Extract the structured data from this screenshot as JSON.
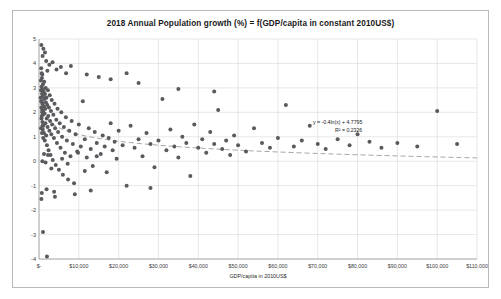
{
  "chart_data": {
    "type": "scatter",
    "title": "2018 Annual Population growth (%) = f(GDP/capita in constant 2010US$)",
    "xlabel": "GDP/capita in 2010US$",
    "ylabel": "Annual % population increase",
    "xlim": [
      0,
      110000
    ],
    "ylim": [
      -4,
      5
    ],
    "grid": true,
    "legend": null,
    "xticks": [
      0,
      10000,
      20000,
      30000,
      40000,
      50000,
      60000,
      70000,
      80000,
      90000,
      100000,
      110000
    ],
    "xtick_labels": [
      "$-",
      "$10,000",
      "$20,000",
      "$30,000",
      "$40,000",
      "$50,000",
      "$60,000",
      "$70,000",
      "$80,000",
      "$90,000",
      "$100,000",
      "$110,000"
    ],
    "yticks": [
      -4,
      -3,
      -2,
      -1,
      0,
      1,
      2,
      3,
      4,
      5
    ],
    "ytick_labels": [
      "-4",
      "-3",
      "-2",
      "-1",
      "0",
      "1",
      "2",
      "3",
      "4",
      "5"
    ],
    "marker_color": "#59595e",
    "marker_size": 2.0,
    "trendline": {
      "type": "logarithmic",
      "equation": "y = -0.4ln(x) + 4.7795",
      "r_squared": "R² = 0.2326",
      "slope_coefficient": -0.4,
      "intercept": 4.7795,
      "r2_value": 0.2326,
      "style": "dashed",
      "color": "#8c8c8c"
    },
    "points": [
      [
        420,
        2.6
      ],
      [
        480,
        3.3
      ],
      [
        520,
        2.9
      ],
      [
        560,
        3.8
      ],
      [
        600,
        2.2
      ],
      [
        640,
        3.05
      ],
      [
        680,
        2.45
      ],
      [
        700,
        1.85
      ],
      [
        730,
        3.4
      ],
      [
        760,
        2.75
      ],
      [
        790,
        2.1
      ],
      [
        820,
        3.55
      ],
      [
        850,
        1.6
      ],
      [
        880,
        2.35
      ],
      [
        910,
        2.95
      ],
      [
        940,
        1.3
      ],
      [
        970,
        2.65
      ],
      [
        1000,
        3.15
      ],
      [
        1050,
        2.05
      ],
      [
        1100,
        1.45
      ],
      [
        1150,
        2.85
      ],
      [
        1200,
        2.25
      ],
      [
        1250,
        1.15
      ],
      [
        1300,
        3.25
      ],
      [
        1350,
        2.55
      ],
      [
        1400,
        1.95
      ],
      [
        1450,
        0.85
      ],
      [
        1500,
        2.75
      ],
      [
        1560,
        2.15
      ],
      [
        1620,
        1.55
      ],
      [
        1680,
        3.0
      ],
      [
        1740,
        2.4
      ],
      [
        1800,
        1.05
      ],
      [
        1870,
        2.6
      ],
      [
        1940,
        1.75
      ],
      [
        2000,
        0.65
      ],
      [
        2080,
        2.3
      ],
      [
        2160,
        1.4
      ],
      [
        2240,
        2.9
      ],
      [
        2320,
        1.85
      ],
      [
        2400,
        0.45
      ],
      [
        2500,
        2.2
      ],
      [
        2600,
        1.25
      ],
      [
        2700,
        2.7
      ],
      [
        2800,
        1.65
      ],
      [
        2900,
        0.25
      ],
      [
        3000,
        2.05
      ],
      [
        3100,
        1.1
      ],
      [
        3200,
        2.5
      ],
      [
        3300,
        1.5
      ],
      [
        3450,
        0.05
      ],
      [
        3600,
        1.9
      ],
      [
        3750,
        0.95
      ],
      [
        3900,
        2.35
      ],
      [
        4050,
        1.35
      ],
      [
        4200,
        -0.15
      ],
      [
        4350,
        1.7
      ],
      [
        4500,
        0.75
      ],
      [
        4650,
        2.15
      ],
      [
        4800,
        1.2
      ],
      [
        5000,
        -0.35
      ],
      [
        5200,
        1.55
      ],
      [
        5400,
        0.55
      ],
      [
        5600,
        2.0
      ],
      [
        5800,
        1.0
      ],
      [
        6000,
        -0.55
      ],
      [
        6250,
        1.4
      ],
      [
        6500,
        0.35
      ],
      [
        6750,
        1.8
      ],
      [
        7000,
        0.85
      ],
      [
        7300,
        -0.75
      ],
      [
        7600,
        1.25
      ],
      [
        7900,
        0.2
      ],
      [
        8200,
        1.65
      ],
      [
        8500,
        0.7
      ],
      [
        8800,
        -0.9
      ],
      [
        9200,
        1.1
      ],
      [
        9600,
        0.4
      ],
      [
        10000,
        1.5
      ],
      [
        10500,
        0.6
      ],
      [
        11000,
        2.45
      ],
      [
        11500,
        0.9
      ],
      [
        12000,
        0.15
      ],
      [
        12500,
        1.35
      ],
      [
        13000,
        0.5
      ],
      [
        13500,
        -0.2
      ],
      [
        14000,
        1.2
      ],
      [
        14500,
        0.75
      ],
      [
        15000,
        3.45
      ],
      [
        15500,
        0.3
      ],
      [
        16000,
        1.05
      ],
      [
        16500,
        0.6
      ],
      [
        17000,
        -0.45
      ],
      [
        17500,
        0.95
      ],
      [
        18000,
        1.55
      ],
      [
        18500,
        0.45
      ],
      [
        19000,
        0.8
      ],
      [
        19500,
        0.1
      ],
      [
        20000,
        1.25
      ],
      [
        21000,
        0.65
      ],
      [
        22000,
        -1.0
      ],
      [
        23000,
        1.45
      ],
      [
        24000,
        0.55
      ],
      [
        25000,
        0.9
      ],
      [
        26000,
        0.2
      ],
      [
        27000,
        1.15
      ],
      [
        28000,
        0.7
      ],
      [
        29000,
        -0.25
      ],
      [
        30000,
        0.85
      ],
      [
        31000,
        2.55
      ],
      [
        32000,
        0.45
      ],
      [
        33000,
        1.3
      ],
      [
        34000,
        0.6
      ],
      [
        35000,
        0.15
      ],
      [
        36000,
        1.0
      ],
      [
        37000,
        0.75
      ],
      [
        38000,
        -0.6
      ],
      [
        39000,
        1.5
      ],
      [
        40000,
        0.55
      ],
      [
        41000,
        0.9
      ],
      [
        42000,
        0.35
      ],
      [
        43000,
        1.2
      ],
      [
        44000,
        0.7
      ],
      [
        45000,
        2.1
      ],
      [
        46000,
        0.5
      ],
      [
        47000,
        0.85
      ],
      [
        48000,
        0.25
      ],
      [
        49000,
        1.05
      ],
      [
        50000,
        0.65
      ],
      [
        52000,
        0.4
      ],
      [
        54000,
        1.35
      ],
      [
        56000,
        0.75
      ],
      [
        58000,
        0.55
      ],
      [
        60000,
        0.95
      ],
      [
        62000,
        2.3
      ],
      [
        64000,
        0.6
      ],
      [
        66000,
        0.85
      ],
      [
        68000,
        1.45
      ],
      [
        70000,
        0.7
      ],
      [
        72000,
        0.5
      ],
      [
        75000,
        0.9
      ],
      [
        78000,
        0.65
      ],
      [
        80000,
        1.1
      ],
      [
        83000,
        0.8
      ],
      [
        86000,
        0.55
      ],
      [
        90000,
        0.75
      ],
      [
        95000,
        0.6
      ],
      [
        100000,
        2.05
      ],
      [
        105000,
        0.7
      ],
      [
        1800,
        4.1
      ],
      [
        2600,
        3.95
      ],
      [
        3400,
        4.05
      ],
      [
        5500,
        3.85
      ],
      [
        8000,
        3.9
      ],
      [
        900,
        4.3
      ],
      [
        1500,
        4.45
      ],
      [
        2100,
        3.7
      ],
      [
        4400,
        3.75
      ],
      [
        6800,
        3.6
      ],
      [
        600,
        4.75
      ],
      [
        1100,
        4.6
      ],
      [
        12000,
        3.55
      ],
      [
        18000,
        3.35
      ],
      [
        25000,
        3.2
      ],
      [
        700,
        -1.3
      ],
      [
        1900,
        -1.15
      ],
      [
        3800,
        -1.25
      ],
      [
        9000,
        -1.35
      ],
      [
        13000,
        -1.2
      ],
      [
        28000,
        -1.1
      ],
      [
        22000,
        3.6
      ],
      [
        35000,
        2.95
      ],
      [
        44000,
        2.85
      ],
      [
        1000,
        -2.9
      ],
      [
        2000,
        -3.9
      ],
      [
        600,
        -1.55
      ],
      [
        4000,
        -1.45
      ],
      [
        850,
        0.0
      ],
      [
        1250,
        0.3
      ],
      [
        1650,
        -0.05
      ],
      [
        2250,
        0.25
      ],
      [
        3100,
        -0.3
      ],
      [
        5800,
        0.1
      ],
      [
        7200,
        -0.1
      ],
      [
        9800,
        0.35
      ],
      [
        11500,
        -0.4
      ],
      [
        14500,
        0.2
      ],
      [
        500,
        1.35
      ],
      [
        550,
        2.45
      ],
      [
        620,
        1.75
      ],
      [
        680,
        3.6
      ],
      [
        740,
        1.15
      ],
      [
        800,
        2.0
      ],
      [
        870,
        1.45
      ],
      [
        930,
        2.8
      ],
      [
        990,
        1.9
      ],
      [
        1060,
        0.95
      ]
    ]
  }
}
